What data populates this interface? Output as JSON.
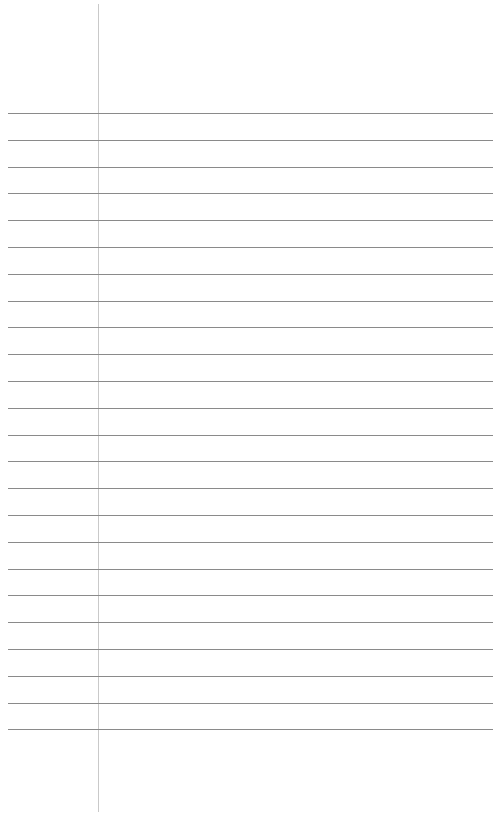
{
  "paper": {
    "type": "lined-paper",
    "background": "#ffffff",
    "margin_line": {
      "x": 98,
      "top": 4,
      "bottom": 812,
      "color": "#c9c9c9"
    },
    "rules": {
      "count": 24,
      "first_y": 113,
      "spacing": 26.8,
      "left": 8,
      "right": 493,
      "color": "#8a8a8a"
    },
    "text": []
  }
}
